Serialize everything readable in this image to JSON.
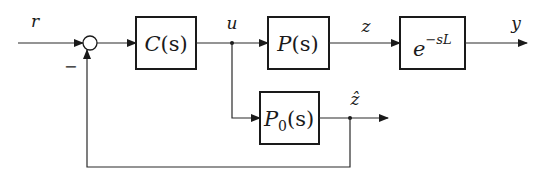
{
  "diagram": {
    "type": "block-diagram",
    "signals": {
      "r": "r",
      "u": "u",
      "z": "z",
      "y": "y",
      "z_hat": "ẑ",
      "minus": "−"
    },
    "blocks": {
      "controller": {
        "name": "C",
        "arg": "(s)"
      },
      "plant": {
        "name": "P",
        "arg": "(s)"
      },
      "delay": {
        "base": "e",
        "exponent": "−sL"
      },
      "model": {
        "name": "P",
        "sub": "0",
        "arg": "(s)"
      }
    },
    "connections": [
      {
        "from": "r",
        "to": "summing-junction"
      },
      {
        "from": "summing-junction",
        "to": "controller"
      },
      {
        "from": "controller",
        "to": "plant",
        "signal": "u"
      },
      {
        "from": "plant",
        "to": "delay",
        "signal": "z"
      },
      {
        "from": "delay",
        "to": "output",
        "signal": "y"
      },
      {
        "from": "u-branch",
        "to": "model"
      },
      {
        "from": "model",
        "to": "output-zhat",
        "signal": "ẑ"
      },
      {
        "from": "zhat-branch",
        "to": "summing-junction",
        "sign": "−"
      }
    ]
  }
}
